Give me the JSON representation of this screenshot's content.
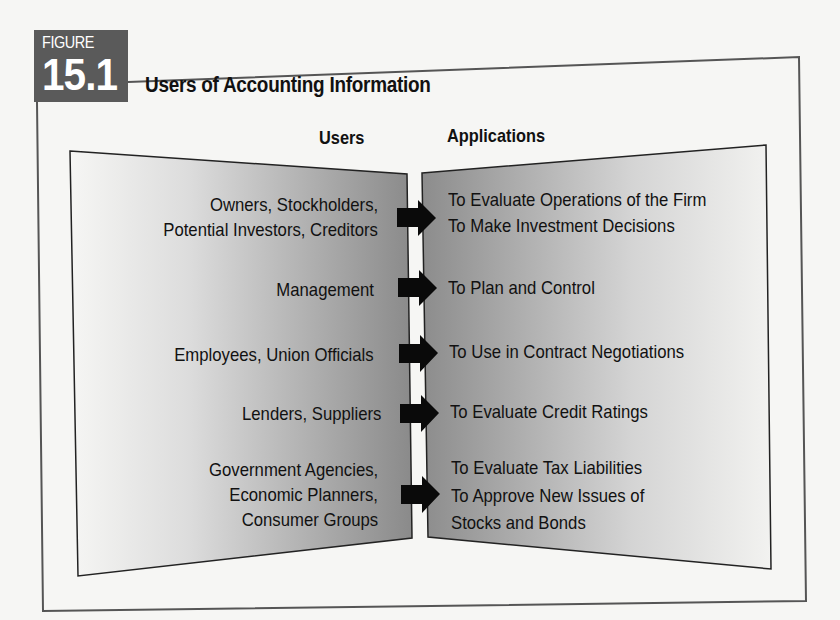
{
  "figure": {
    "badge_label": "FIGURE",
    "badge_number": "15.1",
    "title": "Users of Accounting Information"
  },
  "columns": {
    "users_header": "Users",
    "applications_header": "Applications"
  },
  "rows": [
    {
      "users": [
        "Owners, Stockholders,",
        "Potential Investors, Creditors"
      ],
      "applications": [
        "To Evaluate Operations of the Firm",
        "To Make Investment Decisions"
      ]
    },
    {
      "users": [
        "Management"
      ],
      "applications": [
        "To Plan and Control"
      ]
    },
    {
      "users": [
        "Employees, Union Officials"
      ],
      "applications": [
        "To Use in Contract Negotiations"
      ]
    },
    {
      "users": [
        "Lenders, Suppliers"
      ],
      "applications": [
        "To Evaluate Credit Ratings"
      ]
    },
    {
      "users": [
        "Government Agencies,",
        "Economic Planners,",
        "Consumer Groups"
      ],
      "applications": [
        "To Evaluate Tax Liabilities",
        "To Approve New Issues of",
        "Stocks and Bonds"
      ]
    }
  ],
  "colors": {
    "badge": "#5a5a5a",
    "frame": "#555555",
    "panel_light": "#f4f4f2",
    "panel_dark": "#8a8a8a",
    "arrow": "#0a0a0a"
  }
}
